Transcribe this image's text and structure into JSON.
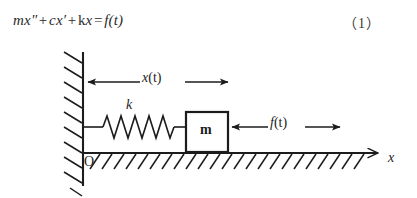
{
  "figure": {
    "equation": {
      "full_text": "mx″ + cx′ + kx = f(t)",
      "mass_coeff": "m",
      "x_second_derivative": "x″",
      "plus_1": "+",
      "damping_coeff": "c",
      "x_first_derivative": "x′",
      "plus_2": "+",
      "stiffness_coeff": "k",
      "x_term": "x",
      "equals": "=",
      "forcing": "f(t)"
    },
    "equation_number": "（1）",
    "labels": {
      "displacement": "x(t)",
      "spring_constant": "k",
      "mass": "m",
      "force": "f(t)",
      "origin": "O",
      "axis": "x"
    },
    "colors": {
      "stroke": "#1c1c1c",
      "text": "#1c1c1c",
      "background": "#ffffff",
      "equation_text": "#2a2a2a"
    },
    "geometry": {
      "wall_x": 83,
      "wall_top": 52,
      "wall_bottom": 186,
      "ground_y": 153,
      "ground_x_start": 83,
      "ground_x_end": 378,
      "spring_coils": 7,
      "mass_block": {
        "x": 186,
        "y": 112,
        "width": 42,
        "height": 40
      },
      "displacement_arrow_y": 82,
      "force_arrow_y": 127
    }
  }
}
